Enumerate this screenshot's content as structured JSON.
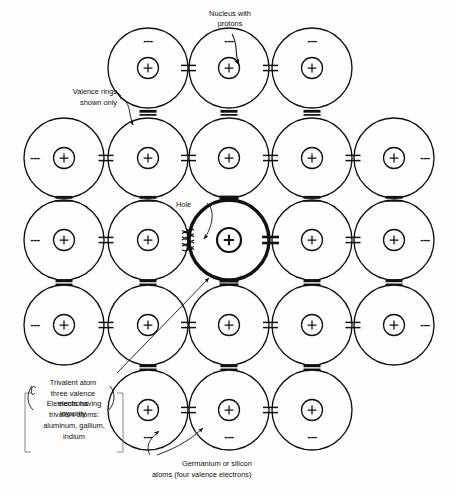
{
  "figure": {
    "background_color": "#fdfdfc",
    "line_color": "#111111"
  },
  "annotations": {
    "nucleus": {
      "line1": "Nucleus with",
      "line2": "protons"
    },
    "valence_rings": {
      "line1": "Valence rings",
      "line2": "shown only"
    },
    "hole": {
      "line1": "Hole"
    },
    "trivalent": {
      "line1": "Trivalent atom",
      "line2": "three valence",
      "line3": "electrons",
      "line4": "impurity"
    },
    "elements_box": {
      "line1": "Elements having",
      "line2": "trivalent atoms:",
      "line3": "aluminum, gallium,",
      "line4": "indium"
    },
    "germanium": {
      "line1": "Germanium or silicon",
      "line2": "atoms (four valence electrons)"
    }
  },
  "symbols": {
    "nucleus_charge": "+",
    "continuation_dashes": "---"
  },
  "lattice": {
    "circle_radius": 40,
    "columns_x": [
      64,
      148,
      229,
      312,
      394
    ],
    "rows_y": [
      68,
      158,
      240,
      325,
      410
    ],
    "impurity_atom": {
      "col": 2,
      "row": 2,
      "bold": true
    },
    "rows": [
      {
        "y": 68,
        "atoms_x": [
          148,
          229,
          312
        ],
        "clip": "top"
      },
      {
        "y": 158,
        "atoms_x": [
          64,
          148,
          229,
          312,
          394
        ],
        "clip": "sides"
      },
      {
        "y": 240,
        "atoms_x": [
          64,
          148,
          229,
          312,
          394
        ],
        "clip": "sides"
      },
      {
        "y": 325,
        "atoms_x": [
          64,
          148,
          229,
          312,
          394
        ],
        "clip": "sides"
      },
      {
        "y": 410,
        "atoms_x": [
          148,
          229,
          312
        ],
        "clip": "bottom"
      }
    ],
    "edge_dashes": [
      {
        "x": 35,
        "y": 158
      },
      {
        "x": 425,
        "y": 158
      },
      {
        "x": 35,
        "y": 240
      },
      {
        "x": 425,
        "y": 240
      },
      {
        "x": 35,
        "y": 325
      },
      {
        "x": 425,
        "y": 325
      },
      {
        "x": 148,
        "y": 41
      },
      {
        "x": 229,
        "y": 41
      },
      {
        "x": 312,
        "y": 41
      },
      {
        "x": 148,
        "y": 437
      },
      {
        "x": 229,
        "y": 437
      },
      {
        "x": 312,
        "y": 437
      }
    ]
  }
}
